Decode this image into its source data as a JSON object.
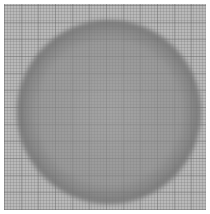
{
  "image": {
    "subject": "dark-rimmed circle on grid background",
    "colors": {
      "margin": "#ffffff",
      "background": "#b9b9b9",
      "rim": "#3a3a3a",
      "center": "#8c8c8c"
    }
  }
}
